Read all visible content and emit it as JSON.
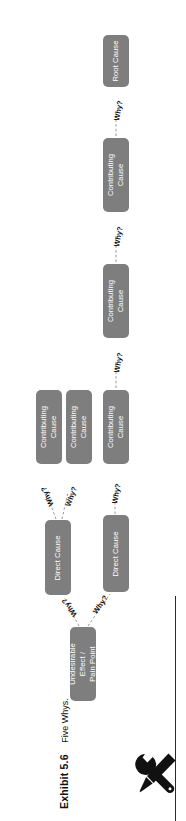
{
  "figure": {
    "exhibit_number": "Exhibit 5.6",
    "caption": "Five Whys.",
    "icon": "tools-wrench-screwdriver-icon",
    "box_color": "#7e7e7e",
    "text_color": "#ffffff",
    "connector_label": "Why?",
    "rotation": "90 degrees counter-clockwise"
  },
  "diagram": {
    "type": "tree",
    "title": "Five Whys",
    "nodes": [
      {
        "id": "n0",
        "label": "Undesirable Effect / Pain Point",
        "level": 0
      },
      {
        "id": "n1",
        "label": "Direct Cause",
        "level": 1
      },
      {
        "id": "n2",
        "label": "Direct Cause",
        "level": 1
      },
      {
        "id": "n3",
        "label": "Contributing Cause",
        "level": 2
      },
      {
        "id": "n4",
        "label": "Contributing Cause",
        "level": 2
      },
      {
        "id": "n5",
        "label": "Contributing Cause",
        "level": 2
      },
      {
        "id": "n6",
        "label": "Contributing Cause",
        "level": 3
      },
      {
        "id": "n7",
        "label": "Contributing Cause",
        "level": 4
      },
      {
        "id": "n8",
        "label": "Root Cause",
        "level": 5
      }
    ],
    "edges": [
      {
        "from": "n0",
        "to": "n1",
        "label": "Why?"
      },
      {
        "from": "n0",
        "to": "n2",
        "label": "Why?"
      },
      {
        "from": "n1",
        "to": "n3",
        "label": "Why?"
      },
      {
        "from": "n1",
        "to": "n4",
        "label": "Why?"
      },
      {
        "from": "n2",
        "to": "n5",
        "label": "Why?"
      },
      {
        "from": "n5",
        "to": "n6",
        "label": "Why?"
      },
      {
        "from": "n6",
        "to": "n7",
        "label": "Why?"
      },
      {
        "from": "n7",
        "to": "n8",
        "label": "Why?"
      }
    ],
    "labels": {
      "root": "Undesirable Effect / Pain Point",
      "direct_cause": "Direct Cause",
      "contributing_cause": "Contributing Cause",
      "root_cause": "Root Cause",
      "why": "Why?"
    }
  }
}
